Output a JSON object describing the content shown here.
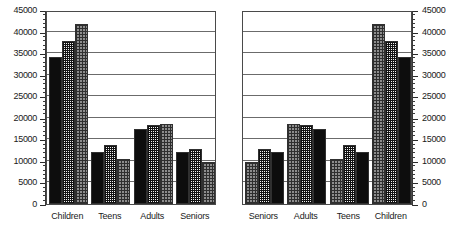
{
  "chart_data": [
    {
      "panel": "left",
      "type": "bar",
      "title": "",
      "xlabel": "",
      "ylabel": "",
      "categories": [
        "Children",
        "Teens",
        "Adults",
        "Seniors"
      ],
      "series": [
        {
          "name": "series-1",
          "pattern": "solid-black",
          "values": [
            34000,
            12000,
            17400,
            12000
          ]
        },
        {
          "name": "series-2",
          "pattern": "fine-checkered",
          "values": [
            37800,
            13800,
            18300,
            12700
          ]
        },
        {
          "name": "series-3",
          "pattern": "gray-dotted",
          "values": [
            41800,
            10500,
            18500,
            9800
          ]
        }
      ],
      "ylim": [
        0,
        45000
      ],
      "ytick_values": [
        0,
        5000,
        10000,
        15000,
        20000,
        25000,
        30000,
        35000,
        40000,
        45000
      ],
      "ytick_labels": [
        "0",
        "5000",
        "10000",
        "15000",
        "20000",
        "25000",
        "30000",
        "35000",
        "40000",
        "45000"
      ],
      "y_axis_position": "left",
      "grid": true,
      "legend": "none",
      "minor_ticks_per_interval": 5
    },
    {
      "panel": "right",
      "type": "bar",
      "title": "",
      "xlabel": "",
      "ylabel": "",
      "categories": [
        "Seniors",
        "Adults",
        "Teens",
        "Children"
      ],
      "series": [
        {
          "name": "series-3",
          "pattern": "gray-dotted",
          "values": [
            9800,
            18500,
            10500,
            41800
          ]
        },
        {
          "name": "series-2",
          "pattern": "fine-checkered",
          "values": [
            12700,
            18300,
            13800,
            37800
          ]
        },
        {
          "name": "series-1",
          "pattern": "solid-black",
          "values": [
            12000,
            17400,
            12000,
            34000
          ]
        }
      ],
      "ylim": [
        0,
        45000
      ],
      "ytick_values": [
        0,
        5000,
        10000,
        15000,
        20000,
        25000,
        30000,
        35000,
        40000,
        45000
      ],
      "ytick_labels": [
        "0",
        "5000",
        "10000",
        "15000",
        "20000",
        "25000",
        "30000",
        "35000",
        "40000",
        "45000"
      ],
      "y_axis_position": "right",
      "grid": true,
      "legend": "none",
      "minor_ticks_per_interval": 5
    }
  ],
  "colors": {
    "series_solid": "#0d0d0d",
    "series_checkered": "#121212",
    "series_dotted": "#8d8d8d",
    "gridline": "#6b6b6b",
    "axis": "#3a3a3a",
    "text": "#1a1a1a",
    "background": "#ffffff"
  }
}
